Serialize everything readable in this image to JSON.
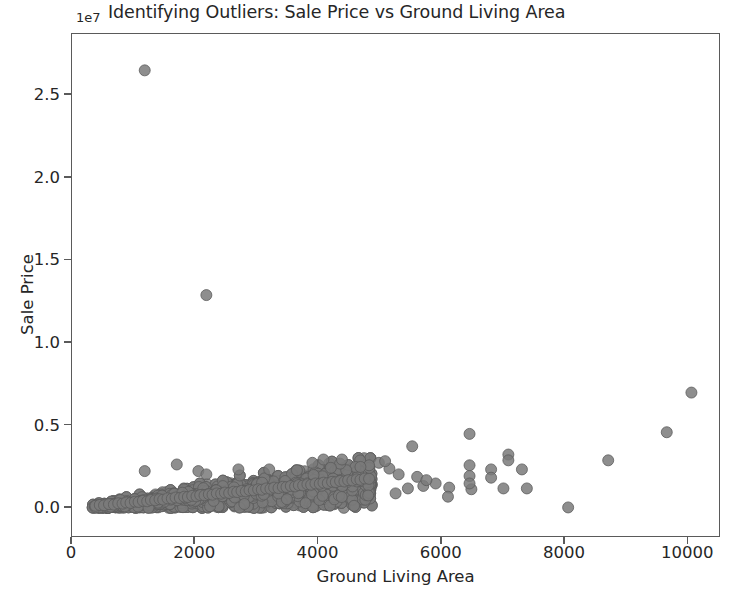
{
  "chart_data": {
    "type": "scatter",
    "title": "Identifying Outliers: Sale Price vs Ground Living Area",
    "xlabel": "Ground Living Area",
    "ylabel": "Sale Price",
    "y_exponent_label": "1e7",
    "y_scale_factor": 10000000,
    "xlim": [
      0,
      10530
    ],
    "ylim": [
      -1800000,
      28700000
    ],
    "xticks": [
      0,
      2000,
      4000,
      6000,
      8000,
      10000
    ],
    "xtick_labels": [
      "0",
      "2000",
      "4000",
      "6000",
      "8000",
      "10000"
    ],
    "yticks": [
      0,
      5000000,
      10000000,
      15000000,
      20000000,
      25000000
    ],
    "ytick_labels": [
      "0.0",
      "0.5",
      "1.0",
      "1.5",
      "2.0",
      "2.5"
    ],
    "grid": false,
    "legend": null,
    "marker": {
      "shape": "circle",
      "facecolor": "#7a7a7a",
      "edgecolor": "#5c5c5c",
      "size_px": 11,
      "alpha": 0.85
    },
    "axes_color": "#5a5a5a",
    "background_color": "#ffffff",
    "series": [
      {
        "name": "Houses",
        "notable_outliers": [
          {
            "x": 1180,
            "y": 26500000,
            "note": "extreme price outlier, small area"
          },
          {
            "x": 2180,
            "y": 12900000,
            "note": "second extreme price outlier"
          },
          {
            "x": 8050,
            "y": 50000,
            "note": "very large area, near-zero price"
          },
          {
            "x": 10050,
            "y": 7000000,
            "note": "largest ground living area"
          },
          {
            "x": 9650,
            "y": 4600000
          },
          {
            "x": 8700,
            "y": 2900000
          },
          {
            "x": 6450,
            "y": 4500000
          },
          {
            "x": 5520,
            "y": 3750000
          }
        ],
        "points": [
          [
            1180,
            26500000
          ],
          [
            2180,
            12900000
          ],
          [
            10050,
            7000000
          ],
          [
            9650,
            4600000
          ],
          [
            6450,
            4500000
          ],
          [
            5520,
            3750000
          ],
          [
            8700,
            2900000
          ],
          [
            7080,
            3250000
          ],
          [
            7080,
            2900000
          ],
          [
            6450,
            2600000
          ],
          [
            7300,
            2350000
          ],
          [
            6800,
            2350000
          ],
          [
            6450,
            1950000
          ],
          [
            6800,
            1850000
          ],
          [
            7000,
            1200000
          ],
          [
            7380,
            1200000
          ],
          [
            6480,
            1150000
          ],
          [
            6120,
            1250000
          ],
          [
            6100,
            700000
          ],
          [
            6450,
            1500000
          ],
          [
            8050,
            50000
          ],
          [
            5150,
            2400000
          ],
          [
            5300,
            2050000
          ],
          [
            4980,
            2750000
          ],
          [
            5080,
            2850000
          ],
          [
            4820,
            2600000
          ],
          [
            4600,
            2500000
          ],
          [
            4450,
            2300000
          ],
          [
            4350,
            2700000
          ],
          [
            4200,
            2450000
          ],
          [
            5600,
            1900000
          ],
          [
            5700,
            1350000
          ],
          [
            5450,
            1200000
          ],
          [
            5250,
            900000
          ],
          [
            5900,
            1500000
          ],
          [
            5750,
            1700000
          ],
          [
            1180,
            2250000
          ],
          [
            1700,
            2650000
          ],
          [
            2050,
            2250000
          ],
          [
            2180,
            2050000
          ],
          [
            2700,
            2350000
          ],
          [
            3200,
            2350000
          ],
          [
            3650,
            2300000
          ],
          [
            3900,
            2750000
          ],
          [
            4080,
            2950000
          ],
          [
            4380,
            2950000
          ],
          [
            4680,
            2500000
          ],
          [
            380,
            150000
          ],
          [
            450,
            200000
          ],
          [
            520,
            180000
          ],
          [
            600,
            250000
          ],
          [
            680,
            220000
          ],
          [
            750,
            300000
          ],
          [
            820,
            280000
          ],
          [
            880,
            350000
          ],
          [
            950,
            320000
          ],
          [
            1020,
            400000
          ],
          [
            1080,
            380000
          ],
          [
            1150,
            450000
          ],
          [
            1220,
            420000
          ],
          [
            1280,
            500000
          ],
          [
            1350,
            480000
          ],
          [
            1420,
            550000
          ],
          [
            1480,
            520000
          ],
          [
            1550,
            600000
          ],
          [
            1620,
            580000
          ],
          [
            1680,
            650000
          ],
          [
            1750,
            620000
          ],
          [
            1820,
            700000
          ],
          [
            1880,
            680000
          ],
          [
            1950,
            750000
          ],
          [
            2020,
            720000
          ],
          [
            2080,
            800000
          ],
          [
            2150,
            780000
          ],
          [
            2220,
            850000
          ],
          [
            2280,
            820000
          ],
          [
            2350,
            900000
          ],
          [
            2420,
            880000
          ],
          [
            2480,
            950000
          ],
          [
            2550,
            920000
          ],
          [
            2620,
            1000000
          ],
          [
            2680,
            980000
          ],
          [
            2750,
            1050000
          ],
          [
            2820,
            1020000
          ],
          [
            2880,
            1100000
          ],
          [
            2950,
            1080000
          ],
          [
            3020,
            1150000
          ],
          [
            3080,
            1120000
          ],
          [
            3150,
            1200000
          ],
          [
            3220,
            1180000
          ],
          [
            3280,
            1250000
          ],
          [
            3350,
            1220000
          ],
          [
            3420,
            1300000
          ],
          [
            3480,
            1280000
          ],
          [
            3550,
            1350000
          ],
          [
            3620,
            1320000
          ],
          [
            3680,
            1400000
          ],
          [
            3750,
            1380000
          ],
          [
            3820,
            1450000
          ],
          [
            3880,
            1420000
          ],
          [
            3950,
            1500000
          ],
          [
            4020,
            1480000
          ],
          [
            4080,
            1550000
          ],
          [
            4150,
            1520000
          ],
          [
            4220,
            1600000
          ],
          [
            4280,
            1580000
          ],
          [
            4350,
            1650000
          ],
          [
            4420,
            1620000
          ],
          [
            4480,
            1700000
          ],
          [
            4550,
            1680000
          ],
          [
            4620,
            1750000
          ],
          [
            4680,
            1720000
          ],
          [
            4750,
            1800000
          ],
          [
            4820,
            1780000
          ]
        ],
        "point_count_approx": 2600
      }
    ]
  }
}
